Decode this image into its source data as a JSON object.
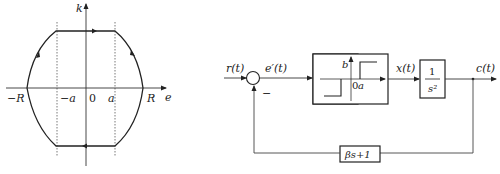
{
  "phase_plane": {
    "x_axis_label": "e",
    "y_axis_label": "k",
    "tick_labels": {
      "neg_R": "−R",
      "neg_a": "−a",
      "origin": "0",
      "pos_a": "a",
      "pos_R": "R"
    },
    "trajectory": "closed limit cycle: flat segments between −a and a, curved arcs through ±R, clockwise direction"
  },
  "block_diagram": {
    "input_label": "r(t)",
    "error_label": "e′(t)",
    "summing_sign": "−",
    "relay_block": {
      "output_level_label": "b",
      "origin_label": "0",
      "deadzone_label": "a"
    },
    "relay_output_label": "x(t)",
    "plant_block": {
      "numerator": "1",
      "denominator": "s²"
    },
    "output_label": "c(t)",
    "feedback_block": {
      "label": "βs+1"
    }
  }
}
